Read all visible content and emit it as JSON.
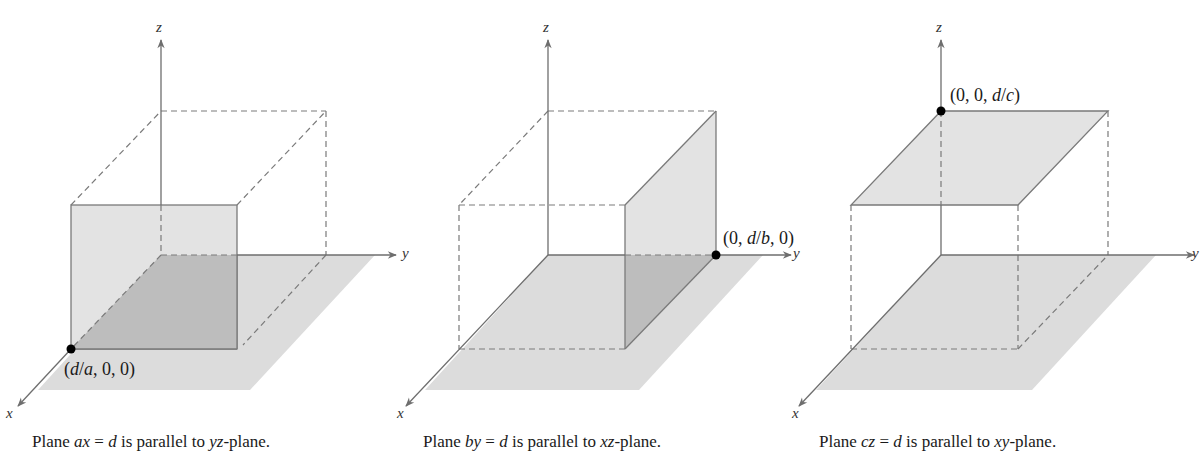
{
  "figure": {
    "panels": [
      {
        "axes": {
          "x": "x",
          "y": "y",
          "z": "z"
        },
        "point_label": "(d/a, 0, 0)",
        "point_label_parts": [
          "(",
          "d",
          "/",
          "a",
          ", 0, 0)"
        ],
        "caption_parts": [
          "Plane ",
          "ax",
          " = ",
          "d",
          " is parallel to ",
          "yz",
          "-plane."
        ],
        "caption": "Plane ax = d is parallel to yz-plane."
      },
      {
        "axes": {
          "x": "x",
          "y": "y",
          "z": "z"
        },
        "point_label": "(0, d/b, 0)",
        "point_label_parts": [
          "(0, ",
          "d",
          "/",
          "b",
          ", 0)"
        ],
        "caption_parts": [
          "Plane ",
          "by",
          " = ",
          "d",
          " is parallel to ",
          "xz",
          "-plane."
        ],
        "caption": "Plane by = d is parallel to xz-plane."
      },
      {
        "axes": {
          "x": "x",
          "y": "y",
          "z": "z"
        },
        "point_label": "(0, 0, d/c)",
        "point_label_parts": [
          "(0, 0, ",
          "d",
          "/",
          "c",
          ")"
        ],
        "caption_parts": [
          "Plane ",
          "cz",
          " = ",
          "d",
          " is parallel to ",
          "xy",
          "-plane."
        ],
        "caption": "Plane cz = d is parallel to xy-plane."
      }
    ],
    "colors": {
      "axis": "#6e6e6e",
      "edge": "#7a7a7a",
      "plane_fill": "#e3e3e3",
      "floor_fill": "#dcdcdc",
      "overlap_fill": "#bdbdbd",
      "point": "#000000"
    }
  }
}
